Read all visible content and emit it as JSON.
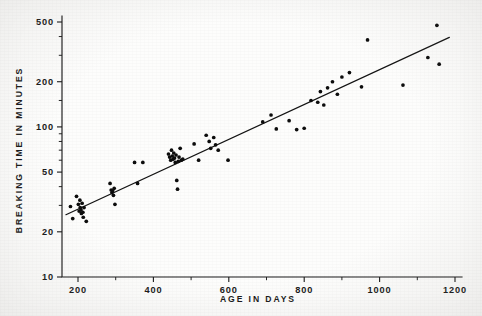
{
  "figure": {
    "name": "breaking-time-vs-age-scatter",
    "background_color": "#fdfdfc",
    "ink_color": "#1a1a1a"
  },
  "chart_data": {
    "type": "scatter",
    "title": "",
    "subtitle": "",
    "xlabel": "AGE IN DAYS",
    "ylabel": "BREAKING TIME IN MINUTES",
    "xscale": "linear",
    "yscale": "log",
    "xlim": [
      150,
      1200
    ],
    "ylim": [
      10,
      700
    ],
    "grid": false,
    "legend": null,
    "xticks": [
      200,
      400,
      600,
      800,
      1000,
      1200
    ],
    "xticklabels": [
      "200",
      "400",
      "600",
      "800",
      "1000",
      "1200"
    ],
    "x_minor_ticks": [
      300,
      500,
      700,
      900,
      1100
    ],
    "yticks": [
      10,
      20,
      50,
      100,
      200,
      500
    ],
    "yticklabels": [
      "10",
      "20",
      "50",
      "100",
      "200",
      "500"
    ],
    "y_minor_ticks": [
      30,
      40,
      60,
      70,
      80,
      90,
      150,
      300,
      400,
      600,
      700
    ],
    "fit_line": {
      "label": "fitted regression line",
      "x_start": 168,
      "y_start": 26.0,
      "x_end": 1185,
      "y_end": 395.0
    },
    "points": [
      {
        "x": 180,
        "y": 29.5
      },
      {
        "x": 186,
        "y": 24.5
      },
      {
        "x": 196,
        "y": 34.5
      },
      {
        "x": 201,
        "y": 30.5
      },
      {
        "x": 203,
        "y": 27.5
      },
      {
        "x": 205,
        "y": 32.5
      },
      {
        "x": 206,
        "y": 29.0
      },
      {
        "x": 208,
        "y": 28.0
      },
      {
        "x": 209,
        "y": 26.5
      },
      {
        "x": 211,
        "y": 31.0
      },
      {
        "x": 213,
        "y": 27.0
      },
      {
        "x": 214,
        "y": 25.0
      },
      {
        "x": 216,
        "y": 29.0
      },
      {
        "x": 222,
        "y": 23.5
      },
      {
        "x": 285,
        "y": 42.0
      },
      {
        "x": 288,
        "y": 38.0
      },
      {
        "x": 290,
        "y": 36.5
      },
      {
        "x": 292,
        "y": 37.5
      },
      {
        "x": 294,
        "y": 35.0
      },
      {
        "x": 296,
        "y": 39.0
      },
      {
        "x": 298,
        "y": 30.5
      },
      {
        "x": 350,
        "y": 58.0
      },
      {
        "x": 358,
        "y": 42.0
      },
      {
        "x": 372,
        "y": 58.0
      },
      {
        "x": 440,
        "y": 66.0
      },
      {
        "x": 443,
        "y": 63.0
      },
      {
        "x": 446,
        "y": 60.0
      },
      {
        "x": 448,
        "y": 70.0
      },
      {
        "x": 450,
        "y": 64.0
      },
      {
        "x": 452,
        "y": 61.0
      },
      {
        "x": 454,
        "y": 67.0
      },
      {
        "x": 456,
        "y": 62.0
      },
      {
        "x": 458,
        "y": 58.0
      },
      {
        "x": 460,
        "y": 65.0
      },
      {
        "x": 462,
        "y": 44.0
      },
      {
        "x": 464,
        "y": 38.5
      },
      {
        "x": 466,
        "y": 59.0
      },
      {
        "x": 468,
        "y": 63.0
      },
      {
        "x": 471,
        "y": 72.0
      },
      {
        "x": 474,
        "y": 60.0
      },
      {
        "x": 478,
        "y": 61.0
      },
      {
        "x": 508,
        "y": 77.0
      },
      {
        "x": 520,
        "y": 60.0
      },
      {
        "x": 540,
        "y": 88.0
      },
      {
        "x": 548,
        "y": 80.0
      },
      {
        "x": 552,
        "y": 72.0
      },
      {
        "x": 560,
        "y": 85.0
      },
      {
        "x": 565,
        "y": 76.0
      },
      {
        "x": 572,
        "y": 70.0
      },
      {
        "x": 598,
        "y": 60.0
      },
      {
        "x": 690,
        "y": 108.0
      },
      {
        "x": 712,
        "y": 120.0
      },
      {
        "x": 726,
        "y": 97.0
      },
      {
        "x": 760,
        "y": 110.0
      },
      {
        "x": 780,
        "y": 96.0
      },
      {
        "x": 800,
        "y": 98.0
      },
      {
        "x": 818,
        "y": 150.0
      },
      {
        "x": 836,
        "y": 146.0
      },
      {
        "x": 843,
        "y": 172.0
      },
      {
        "x": 852,
        "y": 140.0
      },
      {
        "x": 862,
        "y": 182.0
      },
      {
        "x": 875,
        "y": 200.0
      },
      {
        "x": 888,
        "y": 165.0
      },
      {
        "x": 900,
        "y": 215.0
      },
      {
        "x": 920,
        "y": 230.0
      },
      {
        "x": 952,
        "y": 185.0
      },
      {
        "x": 968,
        "y": 380.0
      },
      {
        "x": 1062,
        "y": 190.0
      },
      {
        "x": 1128,
        "y": 290.0
      },
      {
        "x": 1152,
        "y": 475.0
      },
      {
        "x": 1158,
        "y": 262.0
      }
    ]
  }
}
